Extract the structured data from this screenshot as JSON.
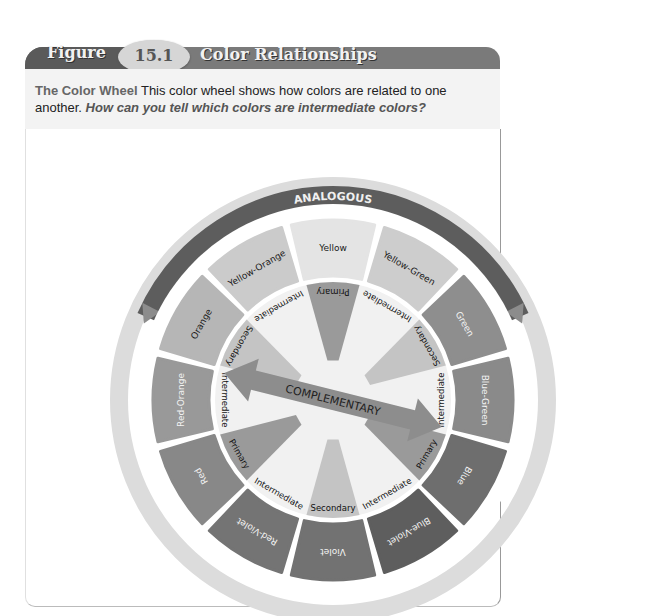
{
  "figure": {
    "label": "Figure",
    "number": "15.1",
    "title": "Color Relationships"
  },
  "caption": {
    "lead": "The Color Wheel",
    "text": " This color wheel shows how colors are related to one another. ",
    "question": "How can you tell which colors are intermediate colors?"
  },
  "wheel": {
    "analogous_label": "ANALOGOUS",
    "complementary_label": "COMPLEMENTARY",
    "outer_segments": [
      {
        "name": "Yellow",
        "shade": "#e4e4e4"
      },
      {
        "name": "Yellow-Green",
        "shade": "#cdcdcd"
      },
      {
        "name": "Green",
        "shade": "#8e8e8e"
      },
      {
        "name": "Blue-Green",
        "shade": "#8a8a8a"
      },
      {
        "name": "Blue",
        "shade": "#6e6e6e"
      },
      {
        "name": "Blue-Violet",
        "shade": "#5e5e5e"
      },
      {
        "name": "Violet",
        "shade": "#727272"
      },
      {
        "name": "Red-Violet",
        "shade": "#747474"
      },
      {
        "name": "Red",
        "shade": "#888888"
      },
      {
        "name": "Red-Orange",
        "shade": "#999999"
      },
      {
        "name": "Orange",
        "shade": "#b6b6b6"
      },
      {
        "name": "Yellow-Orange",
        "shade": "#cbcbcb"
      }
    ],
    "inner_labels": [
      "Primary",
      "Intermediate",
      "Secondary",
      "Intermediate",
      "Primary",
      "Intermediate",
      "Secondary",
      "Intermediate",
      "Primary",
      "Intermediate",
      "Secondary",
      "Intermediate"
    ]
  }
}
